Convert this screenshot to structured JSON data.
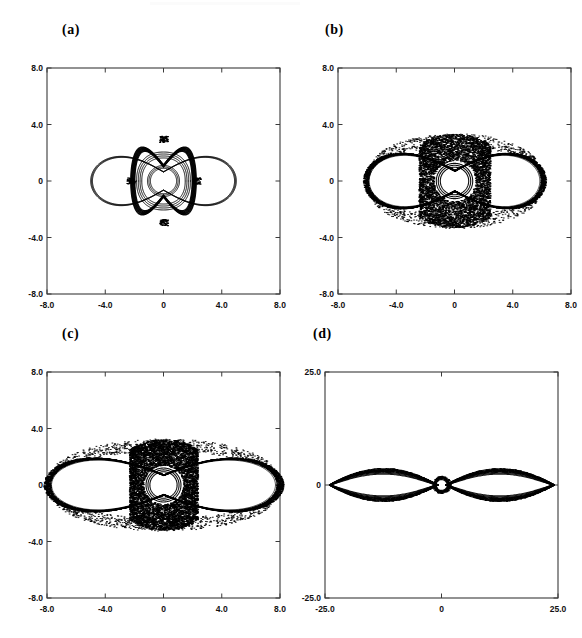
{
  "figure": {
    "type": "multi-panel-phase-portrait",
    "panel_count": 4,
    "background_color": "#ffffff",
    "line_color": "#000000",
    "axis_color": "#3a3a3a"
  },
  "panels": [
    {
      "id": "a",
      "label": "(a)",
      "xlim": [
        -8.0,
        8.0
      ],
      "ylim": [
        -8.0,
        8.0
      ],
      "xticks": [
        "-8.0",
        "-4.0",
        "0",
        "4.0",
        "8.0"
      ],
      "xtick_values": [
        -8.0,
        -4.0,
        0,
        4.0,
        8.0
      ],
      "yticks": [
        "8.0",
        "4.0",
        "0",
        "-4.0",
        "-8.0"
      ],
      "ytick_values": [
        8.0,
        4.0,
        0,
        -4.0,
        -8.0
      ],
      "regime": "quasiperiodic-nested-tori",
      "density": 0.0,
      "outer_lobe_x": 5.0,
      "outer_lobe_y": 3.0,
      "inner_radius": 1.1
    },
    {
      "id": "b",
      "label": "(b)",
      "xlim": [
        -8.0,
        8.0
      ],
      "ylim": [
        -8.0,
        8.0
      ],
      "xticks": [
        "-8.0",
        "-4.0",
        "0",
        "4.0",
        "8.0"
      ],
      "xtick_values": [
        -8.0,
        -4.0,
        0,
        4.0,
        8.0
      ],
      "yticks": [
        "8.0",
        "4.0",
        "0",
        "-4.0",
        "-8.0"
      ],
      "ytick_values": [
        8.0,
        4.0,
        0,
        -4.0,
        -8.0
      ],
      "regime": "chaotic-central-band",
      "density": 0.62,
      "outer_lobe_x": 6.1,
      "outer_lobe_y": 3.3,
      "inner_radius": 1.25
    },
    {
      "id": "c",
      "label": "(c)",
      "xlim": [
        -8.0,
        8.0
      ],
      "ylim": [
        -8.0,
        8.0
      ],
      "xticks": [
        "-8.0",
        "-4.0",
        "0",
        "4.0",
        "8.0"
      ],
      "xtick_values": [
        -8.0,
        -4.0,
        0,
        4.0,
        8.0
      ],
      "yticks": [
        "8.0",
        "4.0",
        "0",
        "-4.0",
        "-8.0"
      ],
      "ytick_values": [
        8.0,
        4.0,
        0,
        -4.0,
        -8.0
      ],
      "regime": "wide-chaotic-sea",
      "density": 0.92,
      "outer_lobe_x": 8.0,
      "outer_lobe_y": 3.2,
      "inner_radius": 1.2
    },
    {
      "id": "d",
      "label": "(d)",
      "xlim": [
        -25.0,
        25.0
      ],
      "ylim": [
        -25.0,
        25.0
      ],
      "xticks": [
        "-25.0",
        "0",
        "25.0"
      ],
      "xtick_values": [
        -25.0,
        0,
        25.0
      ],
      "yticks": [
        "25.0",
        "0",
        "-25.0"
      ],
      "ytick_values": [
        25.0,
        0,
        -25.0
      ],
      "regime": "large-amplitude-thin-lobes",
      "density": 0.18,
      "outer_lobe_x": 24.0,
      "outer_lobe_y": 3.6,
      "inner_radius": 1.6
    }
  ],
  "chart_data": {
    "type": "scatter",
    "title": "",
    "xlabel": "",
    "ylabel": "",
    "grid": false,
    "legend": "none",
    "note": "Four Poincare-section phase portraits of a symmetric two-well oscillator; each panel plots momentum versus position. Panels (a)-(c) share limits [-8,8] on both axes; panel (d) uses [-25,25]. Structures are left-right and up-down symmetric, consisting of two large lobes plus a small central circular island.",
    "subplots": [
      {
        "panel": "a",
        "xlim": [
          -8.0,
          8.0
        ],
        "ylim": [
          -8.0,
          8.0
        ],
        "xticks": [
          -8.0,
          -4.0,
          0,
          4.0,
          8.0
        ],
        "yticks": [
          -8.0,
          -4.0,
          0,
          4.0,
          8.0
        ],
        "curves": [
          {
            "name": "outer-double-lobe",
            "kind": "closed-curve",
            "x_extent": [
              -5.0,
              5.0
            ],
            "y_extent": [
              -3.0,
              3.0
            ]
          },
          {
            "name": "middle-thick-torus",
            "kind": "closed-curve",
            "x_extent": [
              -2.2,
              2.2
            ],
            "y_extent": [
              -2.9,
              2.9
            ]
          },
          {
            "name": "inner-torus",
            "kind": "closed-curve",
            "x_extent": [
              -1.8,
              1.8
            ],
            "y_extent": [
              -2.0,
              2.0
            ]
          },
          {
            "name": "core-circle",
            "kind": "closed-curve",
            "x_extent": [
              -1.1,
              1.1
            ],
            "y_extent": [
              -1.1,
              1.1
            ]
          }
        ]
      },
      {
        "panel": "b",
        "xlim": [
          -8.0,
          8.0
        ],
        "ylim": [
          -8.0,
          8.0
        ],
        "xticks": [
          -8.0,
          -4.0,
          0,
          4.0,
          8.0
        ],
        "yticks": [
          -8.0,
          -4.0,
          0,
          4.0,
          8.0
        ],
        "curves": [
          {
            "name": "outer-double-lobe",
            "kind": "thick-band",
            "x_extent": [
              -6.1,
              6.1
            ],
            "y_extent": [
              -3.3,
              3.3
            ]
          },
          {
            "name": "central-chaotic-region",
            "kind": "filled-stochastic",
            "x_extent": [
              -2.4,
              2.4
            ],
            "y_extent": [
              -3.3,
              3.3
            ]
          },
          {
            "name": "core-circle",
            "kind": "closed-curve",
            "x_extent": [
              -1.25,
              1.25
            ],
            "y_extent": [
              -1.25,
              1.25
            ]
          }
        ]
      },
      {
        "panel": "c",
        "xlim": [
          -8.0,
          8.0
        ],
        "ylim": [
          -8.0,
          8.0
        ],
        "xticks": [
          -8.0,
          -4.0,
          0,
          4.0,
          8.0
        ],
        "yticks": [
          -8.0,
          -4.0,
          0,
          4.0,
          8.0
        ],
        "curves": [
          {
            "name": "outer-double-lobe",
            "kind": "thick-band",
            "x_extent": [
              -8.0,
              8.0
            ],
            "y_extent": [
              -3.2,
              3.2
            ]
          },
          {
            "name": "central-chaotic-region",
            "kind": "filled-stochastic",
            "x_extent": [
              -2.3,
              2.3
            ],
            "y_extent": [
              -3.2,
              3.2
            ]
          },
          {
            "name": "core-circle",
            "kind": "closed-curve",
            "x_extent": [
              -1.2,
              1.2
            ],
            "y_extent": [
              -1.2,
              1.2
            ]
          }
        ]
      },
      {
        "panel": "d",
        "xlim": [
          -25.0,
          25.0
        ],
        "ylim": [
          -25.0,
          25.0
        ],
        "xticks": [
          -25.0,
          0,
          25.0
        ],
        "yticks": [
          -25.0,
          0,
          25.0
        ],
        "curves": [
          {
            "name": "left-lens-lobe",
            "kind": "thick-band",
            "x_extent": [
              -24.0,
              -0.8
            ],
            "y_extent": [
              -3.6,
              3.6
            ]
          },
          {
            "name": "right-lens-lobe",
            "kind": "thick-band",
            "x_extent": [
              0.8,
              24.0
            ],
            "y_extent": [
              -3.6,
              3.6
            ]
          },
          {
            "name": "core-circle",
            "kind": "closed-curve",
            "x_extent": [
              -1.6,
              1.6
            ],
            "y_extent": [
              -1.6,
              1.6
            ]
          }
        ]
      }
    ]
  }
}
